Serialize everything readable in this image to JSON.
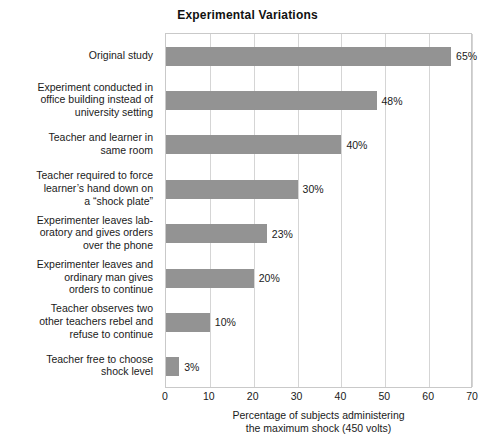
{
  "chart_data": {
    "type": "bar",
    "orientation": "horizontal",
    "title": "Experimental Variations",
    "xlabel_line1": "Percentage of subjects administering",
    "xlabel_line2": "the maximum shock (450 volts)",
    "ylabel": "",
    "xlim": [
      0,
      70
    ],
    "xticks": [
      0,
      10,
      20,
      30,
      40,
      50,
      60,
      70
    ],
    "xtick_labels": [
      "0",
      "10",
      "20",
      "30",
      "40",
      "50",
      "60",
      "70"
    ],
    "grid": true,
    "legend": "none",
    "bar_color": "#939393",
    "categories": [
      "Original study",
      "Experiment conducted in office building instead of university setting",
      "Teacher and learner in same room",
      "Teacher required to force learner's hand down on a “shock plate”",
      "Experimenter leaves laboratory and gives orders over the phone",
      "Experimenter leaves and ordinary man gives orders to continue",
      "Teacher observes two other teachers rebel and refuse to continue",
      "Teacher free to choose shock level"
    ],
    "category_lines": [
      [
        "Original study"
      ],
      [
        "Experiment conducted in",
        "office building instead of",
        "university setting"
      ],
      [
        "Teacher and learner in",
        "same room"
      ],
      [
        "Teacher required to force",
        "learner’s hand down on",
        "a “shock plate”"
      ],
      [
        "Experimenter leaves lab-",
        "oratory and gives orders",
        "over the phone"
      ],
      [
        "Experimenter leaves and",
        "ordinary man gives",
        "orders to continue"
      ],
      [
        "Teacher observes two",
        "other teachers rebel and",
        "refuse to continue"
      ],
      [
        "Teacher free to choose",
        "shock level"
      ]
    ],
    "values": [
      65,
      48,
      40,
      30,
      23,
      20,
      10,
      3
    ],
    "value_labels": [
      "65%",
      "48%",
      "40%",
      "30%",
      "23%",
      "20%",
      "10%",
      "3%"
    ]
  }
}
